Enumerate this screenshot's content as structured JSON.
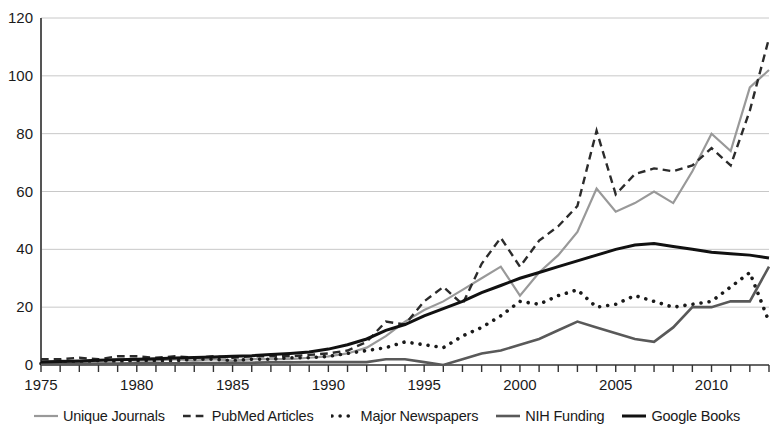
{
  "chart_data": {
    "type": "line",
    "title": "",
    "xlabel": "",
    "ylabel": "",
    "xlim": [
      1975,
      2013
    ],
    "ylim": [
      0,
      120
    ],
    "ytick_step": 20,
    "xtick_step": 5,
    "grid": "horizontal",
    "legend_position": "bottom",
    "x": [
      1975,
      1976,
      1977,
      1978,
      1979,
      1980,
      1981,
      1982,
      1983,
      1984,
      1985,
      1986,
      1987,
      1988,
      1989,
      1990,
      1991,
      1992,
      1993,
      1994,
      1995,
      1996,
      1997,
      1998,
      1999,
      2000,
      2001,
      2002,
      2003,
      2004,
      2005,
      2006,
      2007,
      2008,
      2009,
      2010,
      2011,
      2012,
      2013
    ],
    "xticks": [
      1975,
      1980,
      1985,
      1990,
      1995,
      2000,
      2005,
      2010
    ],
    "yticks": [
      0,
      20,
      40,
      60,
      80,
      100,
      120
    ],
    "series": [
      {
        "name": "Unique Journals",
        "style": "solid",
        "color": "#999999",
        "width": 2.2,
        "values": [
          1,
          1.5,
          1,
          1.5,
          2,
          1.5,
          1.5,
          2,
          1.5,
          2,
          1.5,
          2,
          2,
          2,
          2.5,
          3,
          4,
          6,
          10,
          15,
          19,
          22,
          26,
          30,
          34,
          24,
          32,
          38,
          46,
          61,
          53,
          56,
          60,
          56,
          67,
          80,
          74,
          96,
          102
        ]
      },
      {
        "name": "PubMed Articles",
        "style": "dashed",
        "color": "#2b2b2b",
        "width": 2.4,
        "values": [
          2,
          2,
          2.5,
          2,
          3,
          3,
          2.5,
          3,
          2.5,
          3,
          2.5,
          3,
          3,
          3,
          3.5,
          4,
          5,
          8,
          15,
          14,
          22,
          27,
          21,
          35,
          44,
          34,
          43,
          48,
          55,
          81,
          59,
          66,
          68,
          67,
          69,
          75,
          69,
          88,
          113
        ]
      },
      {
        "name": "Major Newspapers",
        "style": "dotted",
        "color": "#1a1a1a",
        "width": 3.6,
        "values": [
          0.5,
          1,
          1,
          1.5,
          1,
          1.5,
          1.5,
          1.5,
          2,
          2,
          1.5,
          2,
          2,
          2.5,
          2.5,
          3,
          4,
          5,
          6,
          8,
          7,
          6,
          10,
          13,
          17,
          22,
          21,
          24,
          26,
          20,
          21,
          24,
          22,
          20,
          21,
          22,
          27,
          32,
          15
        ]
      },
      {
        "name": "NIH Funding",
        "style": "solid",
        "color": "#595959",
        "width": 2.6,
        "values": [
          0.3,
          0.4,
          0.4,
          0.5,
          0.5,
          0.6,
          0.6,
          0.6,
          0.7,
          0.7,
          0.8,
          0.8,
          0.9,
          0.9,
          1,
          1,
          1,
          1,
          2,
          2,
          1,
          0,
          2,
          4,
          5,
          7,
          9,
          12,
          15,
          13,
          11,
          9,
          8,
          13,
          20,
          20,
          22,
          22,
          34
        ]
      },
      {
        "name": "Google Books",
        "style": "solid",
        "color": "#111111",
        "width": 3.0,
        "values": [
          1,
          1.2,
          1.4,
          1.6,
          1.8,
          2,
          2.2,
          2.4,
          2.6,
          2.8,
          3,
          3.2,
          3.6,
          4,
          4.5,
          5.5,
          7,
          9,
          12,
          14,
          17,
          19.5,
          22,
          25,
          27.5,
          30,
          32,
          34,
          36,
          38,
          40,
          41.5,
          42,
          41,
          40,
          39,
          38.5,
          38,
          37
        ]
      }
    ]
  },
  "legend": {
    "items": [
      {
        "label": "Unique Journals",
        "swatch": "line-solid-light-icon"
      },
      {
        "label": "PubMed Articles",
        "swatch": "line-dashed-icon"
      },
      {
        "label": "Major Newspapers",
        "swatch": "line-dotted-icon"
      },
      {
        "label": "NIH Funding",
        "swatch": "line-solid-gray-icon"
      },
      {
        "label": "Google Books",
        "swatch": "line-solid-black-icon"
      }
    ]
  },
  "axes": {
    "y_tick_labels": [
      "120",
      "100",
      "80",
      "60",
      "40",
      "20",
      "0"
    ],
    "x_tick_labels": [
      "1975",
      "1980",
      "1985",
      "1990",
      "1995",
      "2000",
      "2005",
      "2010"
    ]
  }
}
